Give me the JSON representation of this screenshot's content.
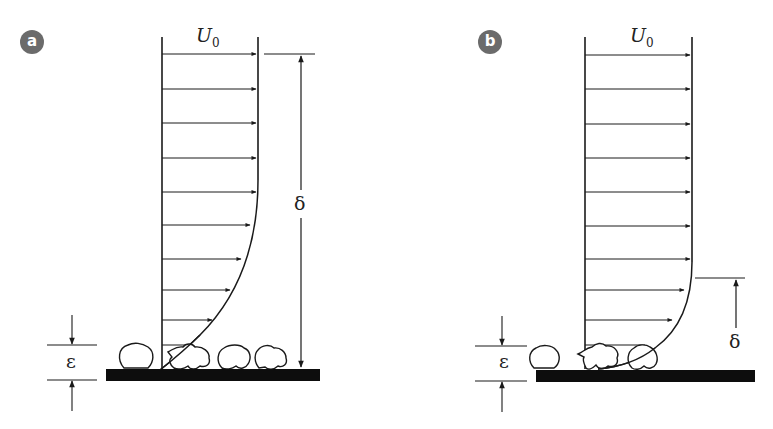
{
  "figure": {
    "colors": {
      "line": "#1a1a1a",
      "plate": "#0d0d0d",
      "badge": "#6b6b6b",
      "background": "#ffffff"
    },
    "panels": [
      {
        "id": "a",
        "badge_label": "a",
        "freestream_label": "U",
        "freestream_subscript": "0",
        "boundary_layer_label": "δ",
        "roughness_label": "ε",
        "note": "Boundary layer thickness δ spans full height; roughness elements protrude through viscous sublayer"
      },
      {
        "id": "b",
        "badge_label": "b",
        "freestream_label": "U",
        "freestream_subscript": "0",
        "boundary_layer_label": "δ",
        "roughness_label": "ε",
        "note": "Thin boundary layer δ; roughness elements comparable to layer thickness"
      }
    ]
  }
}
